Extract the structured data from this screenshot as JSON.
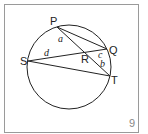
{
  "figure": {
    "number": "9",
    "points": {
      "P": {
        "label": "P",
        "x": 57,
        "y": 27
      },
      "Q": {
        "label": "Q",
        "x": 107,
        "y": 49
      },
      "R": {
        "label": "R",
        "x": 85,
        "y": 53
      },
      "S": {
        "label": "S",
        "x": 28,
        "y": 61
      },
      "T": {
        "label": "T",
        "x": 110,
        "y": 76
      }
    },
    "angles": {
      "a": "a",
      "b": "b",
      "c": "c",
      "d": "d"
    },
    "circle": {
      "cx": 69,
      "cy": 67,
      "r": 42
    },
    "colors": {
      "stroke": "#222222",
      "frame": "#999999",
      "number": "#888888"
    }
  }
}
